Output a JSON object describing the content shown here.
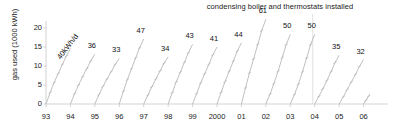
{
  "chart_data": {
    "type": "line",
    "title": "condensing boiler and thermostats installed",
    "xlabel": "",
    "ylabel": "gas used (1000 kWh)",
    "ylim": [
      0,
      22
    ],
    "yticks": [
      0,
      5,
      10,
      15,
      20
    ],
    "ytick_labels": [
      "0",
      "5",
      "10",
      "15",
      "20"
    ],
    "xlim": [
      1993,
      2007
    ],
    "xtick_labels": [
      "93",
      "94",
      "95",
      "96",
      "97",
      "98",
      "99",
      "2000",
      "01",
      "02",
      "03",
      "04",
      "05",
      "06"
    ],
    "grid": false,
    "legend": null,
    "annotations": [
      {
        "text": "40kWh/d",
        "kind": "slope-label",
        "attached_to_year": "93",
        "rotation_deg": -52
      },
      {
        "text": "condensing boiler and thermostats installed",
        "kind": "event-marker",
        "at_year": "04"
      }
    ],
    "series": [
      {
        "name": "93",
        "label": "40kWh/d",
        "label_value": 40,
        "year_end_total": 14.6,
        "points": [
          [
            0,
            0
          ],
          [
            0.17,
            3.0
          ],
          [
            0.33,
            5.6
          ],
          [
            0.5,
            8.0
          ],
          [
            0.67,
            10.4
          ],
          [
            0.83,
            12.6
          ],
          [
            1.0,
            14.6
          ]
        ]
      },
      {
        "name": "94",
        "label": "36",
        "label_value": 36,
        "year_end_total": 13.1,
        "points": [
          [
            0,
            0
          ],
          [
            0.17,
            2.7
          ],
          [
            0.33,
            5.0
          ],
          [
            0.5,
            7.2
          ],
          [
            0.67,
            9.3
          ],
          [
            0.83,
            11.3
          ],
          [
            1.0,
            13.1
          ]
        ]
      },
      {
        "name": "95",
        "label": "33",
        "label_value": 33,
        "year_end_total": 12.0,
        "points": [
          [
            0,
            0
          ],
          [
            0.17,
            2.5
          ],
          [
            0.33,
            4.6
          ],
          [
            0.5,
            6.6
          ],
          [
            0.67,
            8.5
          ],
          [
            0.83,
            10.4
          ],
          [
            1.0,
            12.0
          ]
        ]
      },
      {
        "name": "96",
        "label": "47",
        "label_value": 47,
        "year_end_total": 17.1,
        "points": [
          [
            0,
            0
          ],
          [
            0.17,
            3.4
          ],
          [
            0.33,
            6.4
          ],
          [
            0.5,
            9.3
          ],
          [
            0.67,
            12.1
          ],
          [
            0.83,
            14.8
          ],
          [
            1.0,
            17.1
          ]
        ]
      },
      {
        "name": "97",
        "label": "34",
        "label_value": 34,
        "year_end_total": 12.4,
        "points": [
          [
            0,
            0
          ],
          [
            0.17,
            2.3
          ],
          [
            0.33,
            4.5
          ],
          [
            0.5,
            6.6
          ],
          [
            0.67,
            8.7
          ],
          [
            0.83,
            10.7
          ],
          [
            1.0,
            12.4
          ]
        ]
      },
      {
        "name": "98",
        "label": "43",
        "label_value": 43,
        "year_end_total": 15.7,
        "points": [
          [
            0,
            0
          ],
          [
            0.17,
            3.0
          ],
          [
            0.33,
            5.8
          ],
          [
            0.5,
            8.4
          ],
          [
            0.67,
            11.0
          ],
          [
            0.83,
            13.5
          ],
          [
            1.0,
            15.7
          ]
        ]
      },
      {
        "name": "99",
        "label": "41",
        "label_value": 41,
        "year_end_total": 15.0,
        "points": [
          [
            0,
            0
          ],
          [
            0.17,
            2.8
          ],
          [
            0.33,
            5.5
          ],
          [
            0.5,
            8.0
          ],
          [
            0.67,
            10.5
          ],
          [
            0.83,
            12.9
          ],
          [
            1.0,
            15.0
          ]
        ]
      },
      {
        "name": "2000",
        "label": "44",
        "label_value": 44,
        "year_end_total": 16.1,
        "points": [
          [
            0,
            0
          ],
          [
            0.17,
            3.1
          ],
          [
            0.33,
            5.9
          ],
          [
            0.5,
            8.6
          ],
          [
            0.67,
            11.3
          ],
          [
            0.83,
            13.9
          ],
          [
            1.0,
            16.1
          ]
        ]
      },
      {
        "name": "01",
        "label": "61",
        "label_value": 61,
        "year_end_total": 22.3,
        "points": [
          [
            0,
            0
          ],
          [
            0.17,
            4.3
          ],
          [
            0.33,
            8.2
          ],
          [
            0.5,
            11.9
          ],
          [
            0.67,
            15.7
          ],
          [
            0.83,
            19.3
          ],
          [
            1.0,
            22.3
          ]
        ]
      },
      {
        "name": "02",
        "label": "50",
        "label_value": 50,
        "year_end_total": 18.3,
        "points": [
          [
            0,
            0
          ],
          [
            0.17,
            2.6
          ],
          [
            0.33,
            5.4
          ],
          [
            0.5,
            8.6
          ],
          [
            0.67,
            12.2
          ],
          [
            0.83,
            15.6
          ],
          [
            1.0,
            18.3
          ]
        ]
      },
      {
        "name": "03",
        "label": "50",
        "label_value": 50,
        "year_end_total": 18.3,
        "points": [
          [
            0,
            0
          ],
          [
            0.17,
            2.5
          ],
          [
            0.33,
            5.2
          ],
          [
            0.5,
            8.5
          ],
          [
            0.67,
            12.1
          ],
          [
            0.83,
            15.6
          ],
          [
            1.0,
            18.3
          ]
        ]
      },
      {
        "name": "04",
        "label": "35",
        "label_value": 35,
        "year_end_total": 12.8,
        "points": [
          [
            0,
            0
          ],
          [
            0.17,
            2.0
          ],
          [
            0.33,
            4.0
          ],
          [
            0.5,
            6.2
          ],
          [
            0.67,
            8.5
          ],
          [
            0.83,
            10.9
          ],
          [
            1.0,
            12.8
          ]
        ]
      },
      {
        "name": "05",
        "label": "32",
        "label_value": 32,
        "year_end_total": 11.7,
        "points": [
          [
            0,
            0
          ],
          [
            0.17,
            1.9
          ],
          [
            0.33,
            3.8
          ],
          [
            0.5,
            5.8
          ],
          [
            0.67,
            7.8
          ],
          [
            0.83,
            9.9
          ],
          [
            1.0,
            11.7
          ]
        ]
      },
      {
        "name": "06",
        "label": "",
        "label_value": null,
        "year_end_total": 2.6,
        "points": [
          [
            0,
            0
          ],
          [
            0.1,
            1.0
          ],
          [
            0.2,
            2.0
          ],
          [
            0.25,
            2.6
          ]
        ]
      }
    ],
    "colors": {
      "line": "#b9b9b9",
      "axis": "#c8c8c8",
      "text": "#1a1a1a",
      "marker": "#b0b0b0",
      "event_line": "#dcdcdc"
    }
  }
}
